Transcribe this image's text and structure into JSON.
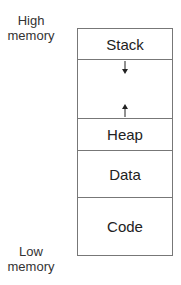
{
  "labels": {
    "high_line1": "High",
    "high_line2": "memory",
    "low_line1": "Low",
    "low_line2": "memory"
  },
  "segments": [
    {
      "name": "Stack"
    },
    {
      "name": ""
    },
    {
      "name": "Heap"
    },
    {
      "name": "Data"
    },
    {
      "name": "Code"
    }
  ],
  "arrows": {
    "stack_growth": "down",
    "heap_growth": "up"
  }
}
